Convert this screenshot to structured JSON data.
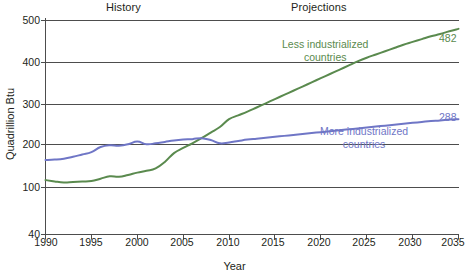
{
  "chart_data": {
    "type": "line",
    "title": "",
    "xlabel": "Year",
    "ylabel": "Quadrillion Btu",
    "xlim": [
      1990,
      2035
    ],
    "ylim": [
      40,
      500
    ],
    "xticks": [
      1990,
      1995,
      2000,
      2005,
      2010,
      2015,
      2020,
      2025,
      2030,
      2035
    ],
    "yticks": [
      40,
      100,
      200,
      300,
      400,
      500
    ],
    "grid": "horizontal",
    "legend": "inline-annotations",
    "annotations": [
      {
        "text": "History",
        "role": "period-band",
        "x_range": [
          1990,
          2010
        ]
      },
      {
        "text": "Projections",
        "role": "period-band",
        "x_range": [
          2010,
          2035
        ]
      }
    ],
    "series": [
      {
        "name": "Less industrialized countries",
        "color": "#5a8a4e",
        "end_value": 482,
        "x": [
          1990,
          1991,
          1992,
          1993,
          1994,
          1995,
          1996,
          1997,
          1998,
          1999,
          2000,
          2001,
          2002,
          2003,
          2004,
          2005,
          2006,
          2007,
          2008,
          2009,
          2010,
          2011,
          2012,
          2013,
          2014,
          2015,
          2016,
          2017,
          2018,
          2019,
          2020,
          2021,
          2022,
          2023,
          2024,
          2025,
          2026,
          2027,
          2028,
          2029,
          2030,
          2031,
          2032,
          2033,
          2034,
          2035
        ],
        "values": [
          157,
          154,
          152,
          153,
          154,
          155,
          160,
          165,
          164,
          168,
          173,
          177,
          182,
          196,
          215,
          226,
          236,
          247,
          259,
          271,
          288,
          296,
          304,
          313,
          322,
          331,
          340,
          349,
          358,
          367,
          376,
          385,
          394,
          403,
          412,
          420,
          427,
          434,
          441,
          448,
          454,
          460,
          466,
          471,
          477,
          482
        ]
      },
      {
        "name": "More industrialized countries",
        "color": "#6f76c6",
        "end_value": 288,
        "x": [
          1990,
          1991,
          1992,
          1993,
          1994,
          1995,
          1996,
          1997,
          1998,
          1999,
          2000,
          2001,
          2002,
          2003,
          2004,
          2005,
          2006,
          2007,
          2008,
          2009,
          2010,
          2011,
          2012,
          2013,
          2014,
          2015,
          2016,
          2017,
          2018,
          2019,
          2020,
          2021,
          2022,
          2023,
          2024,
          2025,
          2026,
          2027,
          2028,
          2029,
          2030,
          2031,
          2032,
          2033,
          2034,
          2035
        ],
        "values": [
          200,
          201,
          203,
          207,
          212,
          217,
          228,
          232,
          231,
          234,
          240,
          234,
          236,
          239,
          242,
          244,
          245,
          247,
          243,
          236,
          238,
          241,
          244,
          246,
          248,
          250,
          252,
          254,
          256,
          258,
          260,
          262,
          264,
          266,
          268,
          270,
          272,
          274,
          276,
          278,
          280,
          282,
          284,
          285,
          287,
          288
        ]
      }
    ]
  },
  "labels": {
    "history": "History",
    "projections": "Projections",
    "y_axis_title": "Quadrillion Btu",
    "x_axis_title": "Year",
    "green_series_line1": "Less industrialized",
    "green_series_line2": "countries",
    "blue_series_line1": "More industrialized",
    "blue_series_line2": "countries",
    "green_end_value": "482",
    "blue_end_value": "288"
  },
  "yticks": {
    "t500": "500",
    "t400": "400",
    "t300": "300",
    "t200": "200",
    "t100": "100",
    "t40": "40"
  },
  "xticks": {
    "t1990": "1990",
    "t1995": "1995",
    "t2000": "2000",
    "t2005": "2005",
    "t2010": "2010",
    "t2015": "2015",
    "t2020": "2020",
    "t2025": "2025",
    "t2030": "2030",
    "t2035": "2035"
  },
  "colors": {
    "green": "#5a8a4e",
    "blue": "#6f76c6",
    "axis": "#4d4d4d",
    "text": "#231f20"
  }
}
